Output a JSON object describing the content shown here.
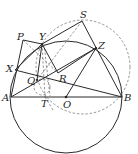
{
  "diagram": {
    "type": "geometry",
    "colors": {
      "stroke": "#2a2a2a",
      "dashed": "#6a6a6a",
      "background": "#ffffff"
    },
    "points": {
      "A": [
        11,
        97
      ],
      "B": [
        122,
        97
      ],
      "O": [
        66,
        97
      ],
      "T": [
        45,
        97
      ],
      "P": [
        23,
        40
      ],
      "Y": [
        42,
        44
      ],
      "S": [
        82,
        21
      ],
      "Z": [
        96,
        48
      ],
      "X": [
        15,
        70
      ],
      "Q": [
        37,
        80
      ],
      "R": [
        58,
        73
      ]
    },
    "labels": {
      "A": "A",
      "B": "B",
      "O": "O",
      "T": "T",
      "P": "P",
      "Y": "Y",
      "S": "S",
      "Z": "Z",
      "X": "X",
      "Q": "Q",
      "R": "R"
    },
    "circles": [
      {
        "name": "main-circle",
        "center": "O",
        "radius": 56,
        "style": "solid"
      },
      {
        "name": "dashed-circle",
        "center": [
          83,
          67
        ],
        "radius": 47,
        "style": "dashed"
      },
      {
        "name": "small-dashed-circle",
        "center": [
          42,
          86
        ],
        "radius": 9,
        "style": "dashed"
      }
    ],
    "segments_solid": [
      [
        "A",
        "B"
      ],
      [
        "P",
        "Y"
      ],
      [
        "P",
        "A"
      ],
      [
        "Y",
        "S"
      ],
      [
        "S",
        "B"
      ],
      [
        "Y",
        "R"
      ],
      [
        "R",
        "Z"
      ],
      [
        "A",
        "Z"
      ],
      [
        "X",
        "B"
      ],
      [
        "Z",
        "O"
      ],
      [
        "X",
        "Y"
      ],
      [
        "Y",
        "Q"
      ]
    ],
    "segments_dashed": [
      [
        "P",
        "R"
      ],
      [
        "Y",
        "T"
      ],
      [
        "S",
        "Q"
      ],
      [
        "Y",
        "O"
      ]
    ]
  }
}
